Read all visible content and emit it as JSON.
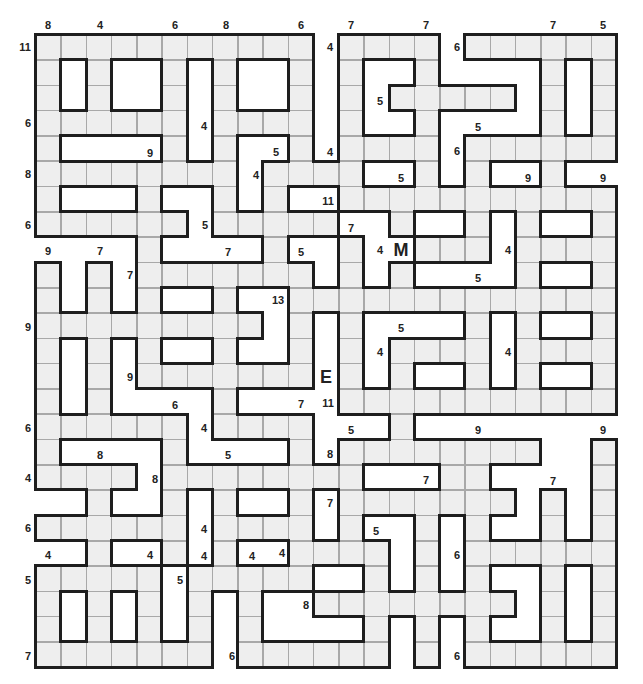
{
  "puzzle": {
    "grid": {
      "origin_x": 35.5,
      "origin_y": 34.5,
      "cell_w": 25.25,
      "cell_h": 25.3,
      "cols": 23,
      "rows": 25,
      "legend": {
        "F": "shaded-cell",
        ".": "blank"
      },
      "cells": [
        "FFFFFFFFFFF.FFFF.FFFFFF",
        "F.F..F.F..F.F..F....F.F",
        "F.F..F.F..F.F.FFFFF.F.F",
        "FFFFFF.FFFF.F..F....F.F",
        "F....F.F..F.FFFF.FFFFFF",
        "FFFFFFFF.FFFF..F.F..F..",
        "F...F..F.F..FFFFFFFFFFF",
        "FFFFFF.FFFFF..F..F.F..F",
        "....F....F..F..FFF.FFFF",
        "F.F.FFFFFFF.F.F....F..F",
        "F.F.F..F..FFFFFFFFFFFFF",
        "FFFFFFFFF.F.F....F.F..F",
        "F.F.F..F..F.F.FFFF.FFFF",
        "F.F.FFFFFFF.F.F..F.F..F",
        "F.F....F....FFFFFFFFFFF",
        "FFFFFF.FFFF...F........",
        "F....F....F.FFFFFFFF..F",
        "FFFF.FFFFFFFF...FF....F",
        "..F..F.F..F.FFFFFFF.F.F",
        "FFFFFF.FFFF.F..F.F..F.F",
        "..F..F.F..FFFF.F.FFFFFF",
        "FFFFF.FFFFF..F.F.F..F.F",
        "F.F.F.F.F..FFFFFFFF.F.F",
        "F.F.F.F.F....F.F.F..F.F",
        "FFFFFFF.FFFFFF.F.FFFFFF"
      ]
    },
    "colors": {
      "cell_fill": "#eeeeee",
      "cell_line": "#a8a8a8",
      "wall": "#1e1e1e",
      "text": "#222222",
      "background": "#ffffff"
    },
    "markers": {
      "start": {
        "text": "M",
        "x": 401,
        "y": 250
      },
      "end": {
        "text": "E",
        "x": 326,
        "y": 377
      }
    },
    "labels": [
      {
        "text": "8",
        "x": 48,
        "y": 25
      },
      {
        "text": "4",
        "x": 100,
        "y": 25
      },
      {
        "text": "6",
        "x": 175,
        "y": 25
      },
      {
        "text": "8",
        "x": 226,
        "y": 25
      },
      {
        "text": "6",
        "x": 301,
        "y": 25
      },
      {
        "text": "7",
        "x": 351,
        "y": 25
      },
      {
        "text": "7",
        "x": 426,
        "y": 25
      },
      {
        "text": "7",
        "x": 553,
        "y": 25
      },
      {
        "text": "5",
        "x": 603,
        "y": 25
      },
      {
        "text": "11",
        "x": 25,
        "y": 47
      },
      {
        "text": "6",
        "x": 28,
        "y": 123
      },
      {
        "text": "8",
        "x": 28,
        "y": 174
      },
      {
        "text": "6",
        "x": 28,
        "y": 225
      },
      {
        "text": "9",
        "x": 48,
        "y": 251
      },
      {
        "text": "7",
        "x": 100,
        "y": 251
      },
      {
        "text": "9",
        "x": 28,
        "y": 327
      },
      {
        "text": "6",
        "x": 28,
        "y": 428
      },
      {
        "text": "4",
        "x": 28,
        "y": 478
      },
      {
        "text": "6",
        "x": 28,
        "y": 528
      },
      {
        "text": "4",
        "x": 48,
        "y": 555
      },
      {
        "text": "5",
        "x": 28,
        "y": 580
      },
      {
        "text": "7",
        "x": 28,
        "y": 656
      },
      {
        "text": "4",
        "x": 330,
        "y": 47
      },
      {
        "text": "6",
        "x": 457,
        "y": 47
      },
      {
        "text": "5",
        "x": 380,
        "y": 101
      },
      {
        "text": "4",
        "x": 204,
        "y": 126
      },
      {
        "text": "5",
        "x": 478,
        "y": 127
      },
      {
        "text": "9",
        "x": 150,
        "y": 153
      },
      {
        "text": "5",
        "x": 276,
        "y": 152
      },
      {
        "text": "4",
        "x": 330,
        "y": 152
      },
      {
        "text": "6",
        "x": 457,
        "y": 151
      },
      {
        "text": "4",
        "x": 256,
        "y": 175
      },
      {
        "text": "5",
        "x": 401,
        "y": 178
      },
      {
        "text": "9",
        "x": 528,
        "y": 178
      },
      {
        "text": "9",
        "x": 603,
        "y": 178
      },
      {
        "text": "11",
        "x": 328,
        "y": 201
      },
      {
        "text": "5",
        "x": 205,
        "y": 225
      },
      {
        "text": "7",
        "x": 351,
        "y": 228
      },
      {
        "text": "7",
        "x": 228,
        "y": 252
      },
      {
        "text": "5",
        "x": 301,
        "y": 252
      },
      {
        "text": "4",
        "x": 380,
        "y": 250
      },
      {
        "text": "4",
        "x": 508,
        "y": 250
      },
      {
        "text": "7",
        "x": 130,
        "y": 275
      },
      {
        "text": "5",
        "x": 478,
        "y": 278
      },
      {
        "text": "13",
        "x": 278,
        "y": 300
      },
      {
        "text": "5",
        "x": 401,
        "y": 328
      },
      {
        "text": "4",
        "x": 380,
        "y": 352
      },
      {
        "text": "4",
        "x": 508,
        "y": 352
      },
      {
        "text": "9",
        "x": 130,
        "y": 377
      },
      {
        "text": "6",
        "x": 175,
        "y": 405
      },
      {
        "text": "7",
        "x": 301,
        "y": 404
      },
      {
        "text": "11",
        "x": 328,
        "y": 403
      },
      {
        "text": "4",
        "x": 204,
        "y": 428
      },
      {
        "text": "5",
        "x": 351,
        "y": 430
      },
      {
        "text": "9",
        "x": 478,
        "y": 430
      },
      {
        "text": "9",
        "x": 603,
        "y": 430
      },
      {
        "text": "8",
        "x": 100,
        "y": 455
      },
      {
        "text": "5",
        "x": 228,
        "y": 455
      },
      {
        "text": "8",
        "x": 330,
        "y": 454
      },
      {
        "text": "8",
        "x": 155,
        "y": 479
      },
      {
        "text": "7",
        "x": 426,
        "y": 480
      },
      {
        "text": "7",
        "x": 553,
        "y": 481
      },
      {
        "text": "7",
        "x": 330,
        "y": 503
      },
      {
        "text": "4",
        "x": 204,
        "y": 529
      },
      {
        "text": "5",
        "x": 376,
        "y": 531
      },
      {
        "text": "6",
        "x": 457,
        "y": 555
      },
      {
        "text": "4",
        "x": 150,
        "y": 555
      },
      {
        "text": "4",
        "x": 204,
        "y": 556
      },
      {
        "text": "4",
        "x": 252,
        "y": 556
      },
      {
        "text": "4",
        "x": 282,
        "y": 553
      },
      {
        "text": "5",
        "x": 180,
        "y": 580
      },
      {
        "text": "8",
        "x": 306,
        "y": 605
      },
      {
        "text": "6",
        "x": 232,
        "y": 656
      },
      {
        "text": "6",
        "x": 457,
        "y": 656
      }
    ]
  }
}
